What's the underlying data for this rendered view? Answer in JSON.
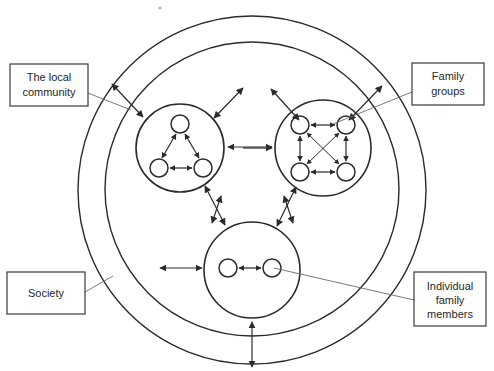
{
  "diagram": {
    "background_color": "#ffffff",
    "line_color": "#2b2b2b",
    "leader_color": "#6a6a6a",
    "labels": [
      {
        "id": "local-community",
        "lines": [
          "The local",
          "community"
        ],
        "box": {
          "x": 10,
          "y": 64,
          "width": 78,
          "height": 42
        },
        "leader": {
          "x1": 88,
          "y1": 93,
          "x2": 131,
          "y2": 110
        }
      },
      {
        "id": "family-groups",
        "lines": [
          "Family",
          "groups"
        ],
        "box": {
          "x": 412,
          "y": 63,
          "width": 72,
          "height": 42
        },
        "leader": {
          "x1": 412,
          "y1": 92,
          "x2": 335,
          "y2": 122
        }
      },
      {
        "id": "society",
        "lines": [
          "Society"
        ],
        "box": {
          "x": 7,
          "y": 272,
          "width": 78,
          "height": 42
        },
        "leader": {
          "x1": 85,
          "y1": 292,
          "x2": 112,
          "y2": 277
        }
      },
      {
        "id": "individual-family-members",
        "lines": [
          "Individual",
          "family",
          "members"
        ],
        "box": {
          "x": 414,
          "y": 272,
          "width": 72,
          "height": 54
        },
        "leader": {
          "x1": 414,
          "y1": 300,
          "x2": 273,
          "y2": 268
        }
      }
    ],
    "rings": [
      {
        "id": "society-ring-outer",
        "cx": 252,
        "cy": 190,
        "r": 174
      },
      {
        "id": "local-community-ring",
        "cx": 252,
        "cy": 189,
        "r": 147
      }
    ],
    "groups": [
      {
        "id": "family-group-left",
        "cx": 180,
        "cy": 148,
        "r": 44,
        "nodes": [
          {
            "id": "left-top",
            "cx": 180,
            "cy": 124,
            "r": 9
          },
          {
            "id": "left-bottom-left",
            "cx": 159,
            "cy": 168,
            "r": 9
          },
          {
            "id": "left-bottom-right",
            "cx": 203,
            "cy": 168,
            "r": 9
          }
        ],
        "links": [
          [
            "left-top",
            "left-bottom-left"
          ],
          [
            "left-top",
            "left-bottom-right"
          ],
          [
            "left-bottom-left",
            "left-bottom-right"
          ]
        ]
      },
      {
        "id": "family-group-right",
        "cx": 323,
        "cy": 148,
        "r": 48,
        "nodes": [
          {
            "id": "right-top-left",
            "cx": 300,
            "cy": 125,
            "r": 9
          },
          {
            "id": "right-top-right",
            "cx": 346,
            "cy": 125,
            "r": 9
          },
          {
            "id": "right-bottom-left",
            "cx": 300,
            "cy": 172,
            "r": 9
          },
          {
            "id": "right-bottom-right",
            "cx": 346,
            "cy": 172,
            "r": 9
          }
        ],
        "links": [
          [
            "right-top-left",
            "right-top-right"
          ],
          [
            "right-bottom-left",
            "right-bottom-right"
          ],
          [
            "right-top-left",
            "right-bottom-left"
          ],
          [
            "right-top-right",
            "right-bottom-right"
          ],
          [
            "right-top-left",
            "right-bottom-right"
          ],
          [
            "right-top-right",
            "right-bottom-left"
          ]
        ]
      },
      {
        "id": "family-group-bottom",
        "cx": 252,
        "cy": 270,
        "r": 48,
        "nodes": [
          {
            "id": "bottom-left",
            "cx": 228,
            "cy": 268,
            "r": 9
          },
          {
            "id": "bottom-right",
            "cx": 272,
            "cy": 268,
            "r": 9
          }
        ],
        "links": [
          [
            "bottom-left",
            "bottom-right"
          ]
        ]
      }
    ],
    "inter_group_arrows": [
      {
        "id": "left-to-right",
        "x1": 228,
        "y1": 147,
        "x2": 273,
        "y2": 147
      },
      {
        "id": "left-to-bottom",
        "x1": 203,
        "y1": 185,
        "x2": 224,
        "y2": 226
      },
      {
        "id": "right-to-bottom",
        "x1": 297,
        "y1": 186,
        "x2": 277,
        "y2": 227
      }
    ],
    "ring_crossing_arrows": [
      {
        "id": "left-group-to-community-nw",
        "x1": 141,
        "y1": 116,
        "x2": 111,
        "y2": 84
      },
      {
        "id": "left-group-to-community-ne",
        "x1": 215,
        "y1": 117,
        "x2": 242,
        "y2": 87
      },
      {
        "id": "right-group-to-community-nw",
        "x1": 298,
        "y1": 119,
        "x2": 270,
        "y2": 88
      },
      {
        "id": "right-group-to-community-ne",
        "x1": 350,
        "y1": 119,
        "x2": 384,
        "y2": 85
      },
      {
        "id": "community-to-bottom-nw",
        "x1": 222,
        "y1": 196,
        "x2": 210,
        "y2": 226
      },
      {
        "id": "community-to-bottom-ne",
        "x1": 283,
        "y1": 196,
        "x2": 294,
        "y2": 226
      },
      {
        "id": "society-to-bottom-left",
        "x1": 160,
        "y1": 268,
        "x2": 202,
        "y2": 268
      },
      {
        "id": "society-to-right-group",
        "x1": 243,
        "y1": 148,
        "x2": 273,
        "y2": 148
      },
      {
        "id": "society-ring-bottom",
        "x1": 252,
        "y1": 322,
        "x2": 252,
        "y2": 368
      }
    ],
    "speck": {
      "cx": 160,
      "cy": 8,
      "r": 1.6
    }
  }
}
